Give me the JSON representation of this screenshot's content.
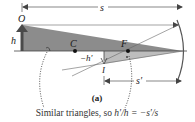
{
  "figure": {
    "panel_label": "(a)",
    "caption_prefix": "Similar triangles, so ",
    "caption_equation": "h′/h = −s′/s",
    "labels": {
      "object": "O",
      "object_height": "h",
      "center": "C",
      "focal_point": "F",
      "image": "I",
      "image_height": "−h′",
      "object_distance": "s",
      "image_distance": "s′"
    },
    "colors": {
      "triangle_fill": "#8c8c8c",
      "triangle_light": "#bdbdbd",
      "object_arrow": "#4a4a4a",
      "lines": "#444444",
      "background": "#ffffff"
    }
  }
}
